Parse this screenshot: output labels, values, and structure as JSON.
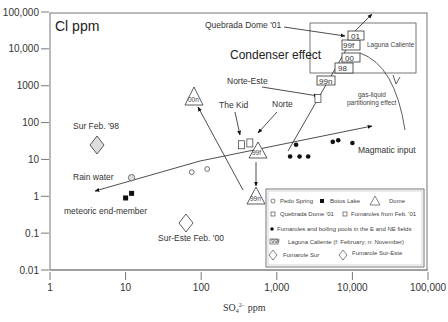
{
  "chart_data": {
    "type": "scatter",
    "title": "",
    "ylabel": "Cl ppm",
    "xlabel": "SO4 2- ppm",
    "xlabel_parts": {
      "base": "SO",
      "sub": "4",
      "sup": "2-",
      "unit": "ppm"
    },
    "xscale": "log",
    "yscale": "log",
    "xlim": [
      1,
      100000
    ],
    "ylim": [
      0.01,
      100000
    ],
    "x_ticks": [
      1,
      10,
      100,
      1000,
      10000,
      100000
    ],
    "x_tick_labels": [
      "1",
      "10",
      "100",
      "1,000",
      "10,000",
      "100,000"
    ],
    "y_ticks": [
      0.01,
      0.1,
      1,
      10,
      100,
      1000,
      10000,
      100000
    ],
    "y_tick_labels": [
      "0.01",
      "0.1",
      "1",
      "10",
      "100",
      "1000",
      "10,000",
      "100,000"
    ],
    "grid": false,
    "legend_position": "bottom-right",
    "series": [
      {
        "name": "Pedo Spring",
        "marker": "open-circle",
        "points": [
          [
            75,
            4.5
          ],
          [
            120,
            5.5
          ]
        ]
      },
      {
        "name": "Rain water",
        "marker": "open-circle-gray",
        "points": [
          [
            12,
            3.2
          ]
        ]
      },
      {
        "name": "Botos Lake",
        "marker": "filled-square",
        "points": [
          [
            10,
            0.9
          ],
          [
            12,
            1.2
          ]
        ]
      },
      {
        "name": "Dome",
        "marker": "triangle",
        "points": [
          {
            "x": 65,
            "y": 500,
            "label": "00n"
          },
          {
            "x": 600,
            "y": 17,
            "label": "99f"
          },
          {
            "x": 600,
            "y": 1.1,
            "label": "99n"
          }
        ]
      },
      {
        "name": "Quebrada Dome '01",
        "marker": "open-square",
        "points": [
          [
            340,
            25
          ]
        ]
      },
      {
        "name": "Fumaroles from Feb. '01",
        "marker": "open-square",
        "points": [
          [
            440,
            28
          ],
          [
            3500,
            450
          ]
        ]
      },
      {
        "name": "Fumaroles and boiling pools in the E and NE fields",
        "marker": "filled-circle",
        "points": [
          [
            1800,
            25
          ],
          [
            1500,
            12
          ],
          [
            2000,
            12
          ],
          [
            2600,
            12
          ],
          [
            5500,
            30
          ],
          [
            6500,
            33
          ],
          [
            10000,
            28
          ]
        ]
      },
      {
        "name": "Laguna Caliente (f: February; n: November)",
        "marker": "labeled-box",
        "points": [
          {
            "x": 4000,
            "y": 800,
            "label": "99n"
          },
          {
            "x": 5500,
            "y": 2400,
            "label": "98"
          },
          {
            "x": 7500,
            "y": 5000,
            "label": "00"
          },
          {
            "x": 7000,
            "y": 10000,
            "label": "99f"
          },
          {
            "x": 9000,
            "y": 14000,
            "label": "01"
          }
        ]
      },
      {
        "name": "Fumarole Sur",
        "marker": "diamond-gray",
        "points": [
          {
            "x": 4.5,
            "y": 22,
            "label": "Sur Feb. '98"
          }
        ]
      },
      {
        "name": "Fumarole Sur-Este",
        "marker": "diamond",
        "points": [
          {
            "x": 70,
            "y": 0.18,
            "label": "Sur-Este Feb. '00"
          }
        ]
      }
    ],
    "annotations": [
      "Condenser effect",
      "Quebrada Dome '01",
      "Laguna Caliente",
      "Norte-Este",
      "The Kid",
      "Norte",
      "gas-liquid partitioning effect",
      "Magmatic input",
      "Sur Feb. '98",
      "Rain water",
      "meteoric end-member",
      "Sur-Este  Feb. '00"
    ],
    "legend": [
      "Pedo Spring",
      "Botos Lake",
      "Dome",
      "Quebrada Dome '01",
      "Fumaroles from Feb. '01",
      "Fumaroles and boiling pools in the E and NE fields",
      "Laguna Caliente (f: February; n: November)",
      "Fumarole Sur",
      "Fumarole Sur-Este"
    ]
  },
  "labels": {
    "condenser": "Condenser effect",
    "quebrada": "Quebrada Dome '01",
    "laguna": "Laguna Caliente",
    "norte_este": "Norte-Este",
    "the_kid": "The Kid",
    "norte": "Norte",
    "gas1": "gas-liquid",
    "gas2": "partitioning effect",
    "magmatic": "Magmatic input",
    "sur98": "Sur Feb. '98",
    "rain": "Rain water",
    "meteoric": "meteoric end-member",
    "sureste": "Sur-Este  Feb. '00",
    "lab_00n": "00n",
    "lab_99f_dome": "99f",
    "lab_99n_dome": "99n",
    "lc_01": "01",
    "lc_99f": "99f",
    "lc_00": "00",
    "lc_98": "98",
    "lc_99n": "99n",
    "lc_icon": "99f"
  },
  "legend": {
    "pedo": "Pedo Spring",
    "botos": "Botos Lake",
    "dome": "Dome",
    "quebrada": "Quebrada Dome '01",
    "fumfeb": "Fumaroles from Feb. '01",
    "fumpools": "Fumaroles and boiling pools in the E and NE fields",
    "laguna": "Laguna Caliente (f: February; n: November)",
    "sur": "Fumarole Sur",
    "sureste": "Fumarole Sur-Este"
  },
  "axes": {
    "ylabel": "Cl ppm",
    "x_base": "SO",
    "x_sub": "4",
    "x_sup": "2-",
    "x_unit": "ppm",
    "xt": [
      "1",
      "10",
      "100",
      "1,000",
      "10,000",
      "100,000"
    ],
    "yt": [
      "0.01",
      "0.1",
      "1",
      "10",
      "100",
      "1000",
      "10,000",
      "100,000"
    ]
  }
}
